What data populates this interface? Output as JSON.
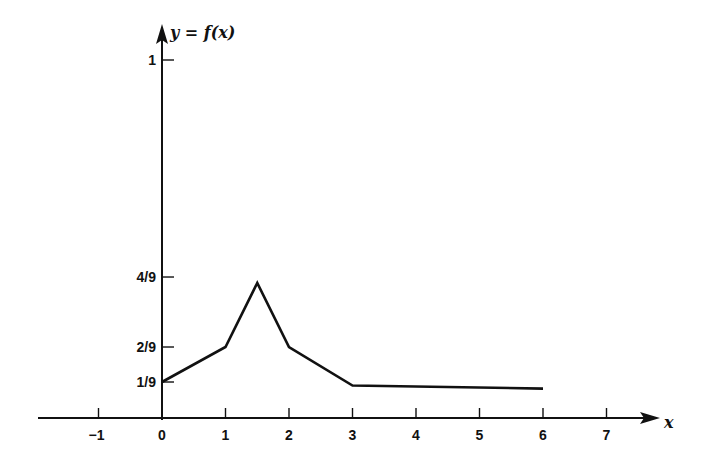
{
  "chart_data": {
    "type": "line",
    "title": "",
    "xlabel": "x",
    "ylabel": "y = f(x)",
    "x_ticks": [
      -1,
      0,
      1,
      2,
      3,
      4,
      5,
      6,
      7
    ],
    "x_tick_labels": [
      "−1",
      "0",
      "1",
      "2",
      "3",
      "4",
      "5",
      "6",
      "7"
    ],
    "y_ticks": [
      0.1111,
      0.2222,
      0.4444,
      1
    ],
    "y_tick_labels": [
      "1/9",
      "2/9",
      "4/9",
      "1"
    ],
    "xlim": [
      -1.9,
      7.8
    ],
    "ylim": [
      0,
      1.05
    ],
    "grid": false,
    "legend": null,
    "series": [
      {
        "name": "f(x)",
        "x": [
          0,
          1,
          1.5,
          2,
          3,
          6
        ],
        "y": [
          0.1111,
          0.2222,
          0.4444,
          0.2222,
          0.1,
          0.09
        ]
      }
    ]
  }
}
